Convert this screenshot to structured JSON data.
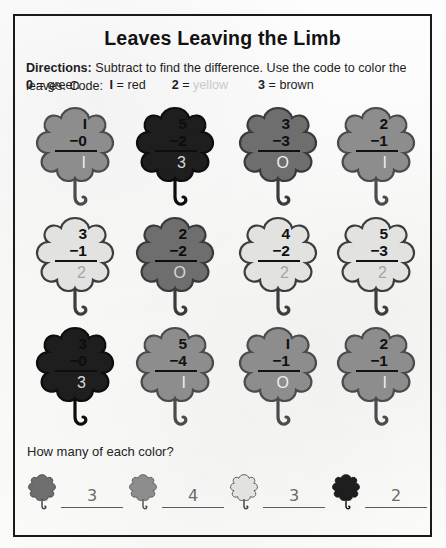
{
  "worksheet": {
    "title": "Leaves Leaving the Limb",
    "directions_label": "Directions:",
    "directions_text": " Subtract to find the difference. Use the code to color the leaves. Code:",
    "code": [
      {
        "number": "0",
        "eq": "=",
        "color_word": "green",
        "faded": false
      },
      {
        "number": "I",
        "eq": "=",
        "color_word": "red",
        "faded": false
      },
      {
        "number": "2",
        "eq": "=",
        "color_word": "yellow",
        "faded": true
      },
      {
        "number": "3",
        "eq": "=",
        "color_word": "brown",
        "faded": false
      }
    ],
    "question": "How many of each color?"
  },
  "colors": {
    "green_fill": "#6e6e6e",
    "green_stroke": "#3a3a3a",
    "red_fill": "#8d8d8d",
    "red_stroke": "#4b4b4b",
    "yellow_fill": "#e2e2e0",
    "yellow_stroke": "#3d3d3d",
    "brown_fill": "#1e1e1e",
    "brown_stroke": "#0d0d0d",
    "ink": "#121212",
    "faded_text": "#c9c9c9"
  },
  "problems": [
    [
      {
        "top": "I",
        "bottom": "−0",
        "answer": "I",
        "color": "red",
        "answer_tone": "ans-on-mid"
      },
      {
        "top": "5",
        "bottom": "−2",
        "answer": "3",
        "color": "brown",
        "answer_tone": "ans-on-dark"
      },
      {
        "top": "3",
        "bottom": "−3",
        "answer": "O",
        "color": "green",
        "answer_tone": "ans-on-mid"
      },
      {
        "top": "2",
        "bottom": "−1",
        "answer": "I",
        "color": "red",
        "answer_tone": "ans-on-mid"
      }
    ],
    [
      {
        "top": "3",
        "bottom": "−1",
        "answer": "2",
        "color": "yellow",
        "answer_tone": "ans-on-light"
      },
      {
        "top": "2",
        "bottom": "−2",
        "answer": "O",
        "color": "green",
        "answer_tone": "ans-on-mid"
      },
      {
        "top": "4",
        "bottom": "−2",
        "answer": "2",
        "color": "yellow",
        "answer_tone": "ans-on-light"
      },
      {
        "top": "5",
        "bottom": "−3",
        "answer": "2",
        "color": "yellow",
        "answer_tone": "ans-on-light"
      }
    ],
    [
      {
        "top": "3",
        "bottom": "−0",
        "answer": "3",
        "color": "brown",
        "answer_tone": "ans-on-dark"
      },
      {
        "top": "5",
        "bottom": "−4",
        "answer": "I",
        "color": "red",
        "answer_tone": "ans-on-mid"
      },
      {
        "top": "I",
        "bottom": "−1",
        "answer": "O",
        "color": "red",
        "answer_tone": "ans-on-mid"
      },
      {
        "top": "2",
        "bottom": "−1",
        "answer": "I",
        "color": "red",
        "answer_tone": "ans-on-mid"
      }
    ]
  ],
  "tally": [
    {
      "color": "green",
      "value": "3"
    },
    {
      "color": "red",
      "value": "4"
    },
    {
      "color": "yellow",
      "value": "3"
    },
    {
      "color": "brown",
      "value": "2"
    }
  ]
}
